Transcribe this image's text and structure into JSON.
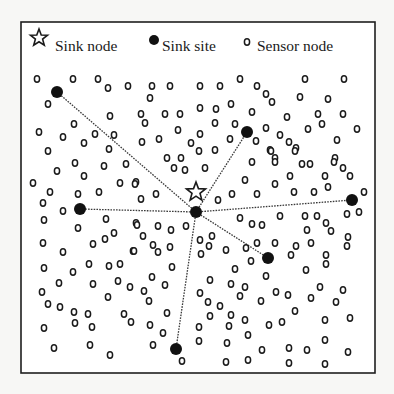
{
  "figure": {
    "width": 394,
    "height": 394,
    "frame": {
      "x": 21,
      "y": 22,
      "w": 354,
      "h": 351
    },
    "colors": {
      "ink": "#1a1a1a",
      "background": "#f7f7f5",
      "panel": "#ffffff"
    }
  },
  "legend": {
    "items": [
      {
        "label": "Sink node",
        "icon": "star-icon",
        "icon_x": 39,
        "icon_y": 38,
        "text_x": 55,
        "text_y": 51
      },
      {
        "label": "Sink site",
        "icon": "filled-circle-icon",
        "icon_x": 154,
        "icon_y": 40,
        "text_x": 162,
        "text_y": 51
      },
      {
        "label": "Sensor node",
        "icon": "hollow-circle-icon",
        "icon_x": 247,
        "icon_y": 42,
        "text_x": 257,
        "text_y": 51
      }
    ]
  },
  "sink_node": {
    "label": "Sink node",
    "x": 196,
    "y": 192
  },
  "sink_sites": [
    {
      "id": "center",
      "x": 196,
      "y": 212
    },
    {
      "id": "top-left",
      "x": 57,
      "y": 92
    },
    {
      "id": "top-right",
      "x": 247,
      "y": 132
    },
    {
      "id": "left",
      "x": 80,
      "y": 209
    },
    {
      "id": "right",
      "x": 352,
      "y": 200
    },
    {
      "id": "lower-right",
      "x": 268,
      "y": 258
    },
    {
      "id": "bottom",
      "x": 176,
      "y": 349
    }
  ],
  "links": [
    {
      "from": "center",
      "to": "top-left"
    },
    {
      "from": "center",
      "to": "top-right"
    },
    {
      "from": "center",
      "to": "left"
    },
    {
      "from": "center",
      "to": "right"
    },
    {
      "from": "center",
      "to": "lower-right"
    },
    {
      "from": "center",
      "to": "bottom"
    }
  ],
  "sensor_nodes": [
    [
      37,
      79
    ],
    [
      73,
      79
    ],
    [
      98,
      79
    ],
    [
      108,
      88
    ],
    [
      128,
      86
    ],
    [
      48,
      104
    ],
    [
      110,
      116
    ],
    [
      39,
      132
    ],
    [
      74,
      124
    ],
    [
      63,
      137
    ],
    [
      95,
      134
    ],
    [
      84,
      143
    ],
    [
      114,
      135
    ],
    [
      48,
      151
    ],
    [
      109,
      149
    ],
    [
      152,
      86
    ],
    [
      170,
      86
    ],
    [
      200,
      86
    ],
    [
      220,
      86
    ],
    [
      240,
      79
    ],
    [
      150,
      98
    ],
    [
      141,
      114
    ],
    [
      165,
      114
    ],
    [
      180,
      114
    ],
    [
      200,
      108
    ],
    [
      216,
      109
    ],
    [
      231,
      104
    ],
    [
      145,
      123
    ],
    [
      215,
      123
    ],
    [
      235,
      124
    ],
    [
      178,
      130
    ],
    [
      142,
      142
    ],
    [
      159,
      139
    ],
    [
      191,
      143
    ],
    [
      200,
      134
    ],
    [
      230,
      139
    ],
    [
      199,
      151
    ],
    [
      215,
      150
    ],
    [
      167,
      158
    ],
    [
      181,
      158
    ],
    [
      305,
      79
    ],
    [
      344,
      79
    ],
    [
      257,
      86
    ],
    [
      266,
      94
    ],
    [
      272,
      102
    ],
    [
      300,
      97
    ],
    [
      328,
      99
    ],
    [
      252,
      112
    ],
    [
      287,
      117
    ],
    [
      318,
      114
    ],
    [
      343,
      114
    ],
    [
      322,
      124
    ],
    [
      266,
      128
    ],
    [
      308,
      129
    ],
    [
      357,
      129
    ],
    [
      280,
      135
    ],
    [
      289,
      142
    ],
    [
      296,
      148
    ],
    [
      337,
      140
    ],
    [
      256,
      141
    ],
    [
      270,
      150
    ],
    [
      275,
      158
    ],
    [
      335,
      158
    ],
    [
      75,
      163
    ],
    [
      104,
      166
    ],
    [
      126,
      164
    ],
    [
      57,
      171
    ],
    [
      84,
      176
    ],
    [
      33,
      183
    ],
    [
      120,
      183
    ],
    [
      136,
      182
    ],
    [
      50,
      192
    ],
    [
      78,
      194
    ],
    [
      99,
      192
    ],
    [
      43,
      203
    ],
    [
      63,
      211
    ],
    [
      44,
      220
    ],
    [
      106,
      219
    ],
    [
      136,
      223
    ],
    [
      78,
      228
    ],
    [
      114,
      233
    ],
    [
      105,
      239
    ],
    [
      174,
      168
    ],
    [
      185,
      170
    ],
    [
      205,
      168
    ],
    [
      135,
      184
    ],
    [
      245,
      180
    ],
    [
      141,
      199
    ],
    [
      156,
      194
    ],
    [
      218,
      200
    ],
    [
      232,
      194
    ],
    [
      240,
      218
    ],
    [
      137,
      225
    ],
    [
      158,
      226
    ],
    [
      171,
      230
    ],
    [
      186,
      226
    ],
    [
      143,
      236
    ],
    [
      200,
      240
    ],
    [
      212,
      236
    ],
    [
      153,
      245
    ],
    [
      170,
      247
    ],
    [
      209,
      246
    ],
    [
      271,
      151
    ],
    [
      295,
      151
    ],
    [
      252,
      162
    ],
    [
      275,
      162
    ],
    [
      302,
      164
    ],
    [
      310,
      164
    ],
    [
      334,
      162
    ],
    [
      343,
      168
    ],
    [
      350,
      176
    ],
    [
      290,
      176
    ],
    [
      325,
      176
    ],
    [
      275,
      184
    ],
    [
      328,
      187
    ],
    [
      257,
      194
    ],
    [
      294,
      192
    ],
    [
      314,
      192
    ],
    [
      364,
      192
    ],
    [
      280,
      216
    ],
    [
      305,
      216
    ],
    [
      317,
      216
    ],
    [
      326,
      223
    ],
    [
      347,
      214
    ],
    [
      359,
      212
    ],
    [
      252,
      224
    ],
    [
      262,
      225
    ],
    [
      307,
      230
    ],
    [
      331,
      231
    ],
    [
      348,
      237
    ],
    [
      43,
      243
    ],
    [
      93,
      244
    ],
    [
      63,
      252
    ],
    [
      133,
      251
    ],
    [
      44,
      268
    ],
    [
      89,
      264
    ],
    [
      109,
      266
    ],
    [
      120,
      264
    ],
    [
      73,
      272
    ],
    [
      59,
      283
    ],
    [
      93,
      284
    ],
    [
      118,
      281
    ],
    [
      130,
      287
    ],
    [
      42,
      292
    ],
    [
      108,
      297
    ],
    [
      48,
      304
    ],
    [
      60,
      307
    ],
    [
      74,
      312
    ],
    [
      88,
      314
    ],
    [
      124,
      314
    ],
    [
      44,
      328
    ],
    [
      75,
      323
    ],
    [
      92,
      327
    ],
    [
      90,
      345
    ],
    [
      54,
      348
    ],
    [
      110,
      355
    ],
    [
      134,
      251
    ],
    [
      158,
      252
    ],
    [
      201,
      254
    ],
    [
      226,
      250
    ],
    [
      246,
      248
    ],
    [
      172,
      267
    ],
    [
      235,
      269
    ],
    [
      152,
      277
    ],
    [
      210,
      280
    ],
    [
      165,
      285
    ],
    [
      231,
      284
    ],
    [
      144,
      291
    ],
    [
      149,
      301
    ],
    [
      200,
      293
    ],
    [
      208,
      302
    ],
    [
      240,
      296
    ],
    [
      167,
      313
    ],
    [
      210,
      316
    ],
    [
      220,
      306
    ],
    [
      231,
      315
    ],
    [
      131,
      322
    ],
    [
      150,
      325
    ],
    [
      199,
      327
    ],
    [
      229,
      326
    ],
    [
      153,
      345
    ],
    [
      257,
      243
    ],
    [
      275,
      243
    ],
    [
      296,
      246
    ],
    [
      311,
      243
    ],
    [
      347,
      246
    ],
    [
      251,
      261
    ],
    [
      291,
      255
    ],
    [
      326,
      255
    ],
    [
      326,
      264
    ],
    [
      306,
      270
    ],
    [
      266,
      276
    ],
    [
      245,
      287
    ],
    [
      276,
      292
    ],
    [
      288,
      295
    ],
    [
      320,
      287
    ],
    [
      343,
      290
    ],
    [
      261,
      301
    ],
    [
      311,
      298
    ],
    [
      336,
      302
    ],
    [
      295,
      311
    ],
    [
      245,
      320
    ],
    [
      269,
      325
    ],
    [
      282,
      322
    ],
    [
      325,
      320
    ],
    [
      350,
      318
    ],
    [
      248,
      335
    ],
    [
      325,
      340
    ],
    [
      262,
      350
    ],
    [
      289,
      348
    ],
    [
      307,
      350
    ],
    [
      348,
      352
    ],
    [
      199,
      341
    ],
    [
      227,
      343
    ],
    [
      182,
      361
    ],
    [
      226,
      362
    ],
    [
      248,
      360
    ],
    [
      289,
      363
    ],
    [
      325,
      364
    ],
    [
      163,
      333
    ]
  ]
}
